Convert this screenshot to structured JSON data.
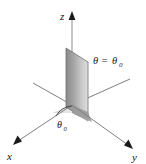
{
  "figure": {
    "kind": "3d-axes-plane-diagram",
    "background_color": "#ffffff",
    "width": 146,
    "height": 164
  },
  "axes": {
    "z": {
      "label": "z",
      "arrow": "up"
    },
    "x": {
      "label": "x",
      "arrow": "down-left"
    },
    "y": {
      "label": "y",
      "arrow": "down-right"
    }
  },
  "plane": {
    "label_theta": "θ",
    "label_equals": "=",
    "label_theta_sub": "θ",
    "label_subscript": "0",
    "full_label": "θ = θ₀",
    "fill_dark": "#8e8e8e",
    "fill_light": "#d8d8d8",
    "edge_color": "#6f6f6f"
  },
  "angle": {
    "label_theta": "θ",
    "label_subscript": "0",
    "full_label": "θ₀",
    "arc_color": "#3a3a3a"
  },
  "colors": {
    "line": "#7a7a7a",
    "line_dark": "#4a4a4a",
    "text": "#111111",
    "floor_wedge": "#bdbdbd",
    "base_wedge": "#9a9a9a"
  }
}
